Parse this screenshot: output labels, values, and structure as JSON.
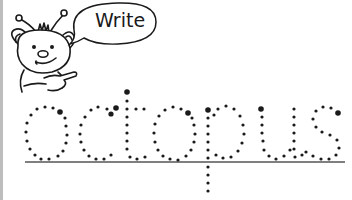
{
  "worksheet": {
    "speech_bubble_text": "Write",
    "tracing_word": "octopus",
    "character": "cartoon-bear-pointing",
    "colors": {
      "ink": "#1a1a1a",
      "baseline": "#555555",
      "border": "#bdbdbd",
      "background": "#ffffff"
    }
  }
}
